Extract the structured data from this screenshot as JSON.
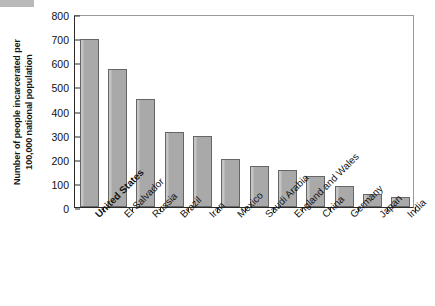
{
  "chart_data": {
    "type": "bar",
    "title": "",
    "xlabel": "",
    "ylabel": "Number of people incarcerated per\n100,000 national population",
    "ylim": [
      0,
      800
    ],
    "yticks": [
      0,
      100,
      200,
      300,
      400,
      500,
      600,
      700,
      800
    ],
    "ytick_labels": [
      "0",
      "100",
      "200",
      "300",
      "400",
      "500",
      "600",
      "700",
      "800"
    ],
    "grid": false,
    "legend": false,
    "bar_color": "#a9a9a9",
    "bar_edge_color": "#666666",
    "axis_color": "#2b2b2b",
    "categories": [
      "United States",
      "El Salvador",
      "Russia",
      "Brazil",
      "Iran",
      "Mexico",
      "Saudi Arabia",
      "England and Wales",
      "China",
      "Germany",
      "Japan",
      "India"
    ],
    "values": [
      698,
      572,
      447,
      313,
      296,
      200,
      168,
      152,
      128,
      89,
      55,
      42
    ],
    "emphasized_category": "United States"
  }
}
